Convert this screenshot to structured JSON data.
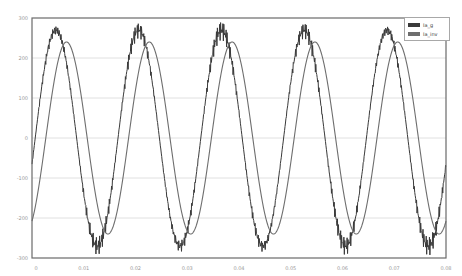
{
  "chart_data": {
    "type": "line",
    "title": "",
    "xlabel": "",
    "ylabel": "",
    "xlim": [
      0,
      0.08
    ],
    "ylim": [
      -300,
      300
    ],
    "grid": true,
    "legend_position": "upper right",
    "x_ticks": [
      "0",
      "0.01",
      "0.02",
      "0.03",
      "0.04",
      "0.05",
      "0.06",
      "0.07",
      "0.08"
    ],
    "y_ticks": [
      "300",
      "200",
      "100",
      "0",
      "-100",
      "-200",
      "-300"
    ],
    "series": [
      {
        "name": "Ia_g",
        "color": "#3a3a3a",
        "description": "Noisy sinusoidal current with switching ripple, ~62 Hz",
        "amplitude": 270,
        "ripple": 25,
        "frequency_hz": 62.5,
        "phase_deg": -14,
        "x": [
          0,
          0.002,
          0.004,
          0.006,
          0.008,
          0.01,
          0.012,
          0.014,
          0.016,
          0.018,
          0.02,
          0.022,
          0.024,
          0.026,
          0.028,
          0.03,
          0.032,
          0.034,
          0.036,
          0.038,
          0.04,
          0.042,
          0.044,
          0.046,
          0.048,
          0.05,
          0.052,
          0.054,
          0.056,
          0.058,
          0.06,
          0.062,
          0.064,
          0.066,
          0.068,
          0.07,
          0.072,
          0.074,
          0.076,
          0.078,
          0.08
        ],
        "values": [
          -60,
          180,
          275,
          200,
          -20,
          -220,
          -280,
          -180,
          40,
          230,
          275,
          170,
          -70,
          -250,
          -270,
          -130,
          100,
          260,
          265,
          120,
          -120,
          -265,
          -255,
          -90,
          150,
          275,
          235,
          60,
          -170,
          -280,
          -220,
          -20,
          200,
          280,
          195,
          -10,
          -220,
          -275,
          -185,
          30,
          -200
        ]
      },
      {
        "name": "Ia_inv",
        "color": "#6e6e6e",
        "description": "Smooth sinusoidal current lagging Ia_g",
        "amplitude": 240,
        "frequency_hz": 62.5,
        "phase_deg": -60,
        "x": [
          0,
          0.002,
          0.004,
          0.006,
          0.008,
          0.01,
          0.012,
          0.014,
          0.016,
          0.018,
          0.02,
          0.022,
          0.024,
          0.026,
          0.028,
          0.03,
          0.032,
          0.034,
          0.036,
          0.038,
          0.04,
          0.042,
          0.044,
          0.046,
          0.048,
          0.05,
          0.052,
          0.054,
          0.056,
          0.058,
          0.06,
          0.062,
          0.064,
          0.066,
          0.068,
          0.07,
          0.072,
          0.074,
          0.076,
          0.078,
          0.08
        ],
        "values": [
          -210,
          30,
          220,
          230,
          50,
          -180,
          -240,
          -100,
          140,
          240,
          150,
          -80,
          -235,
          -200,
          10,
          215,
          225,
          40,
          -190,
          -235,
          -80,
          160,
          240,
          130,
          -100,
          -240,
          -170,
          60,
          235,
          205,
          -20,
          -220,
          -215,
          -20,
          200,
          230,
          70,
          -170,
          -240,
          -100,
          -190
        ]
      }
    ]
  },
  "legend": {
    "items": [
      {
        "label": "Ia_g",
        "color": "#3a3a3a"
      },
      {
        "label": "Ia_inv",
        "color": "#6e6e6e"
      }
    ]
  },
  "axes": {
    "frame_color": "#6a6a6a",
    "grid_color": "#d8d8d8",
    "tick_label_color": "#9a9a9a"
  }
}
